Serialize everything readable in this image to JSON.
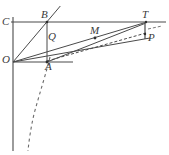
{
  "figure": {
    "type": "geometry-diagram",
    "width": 169,
    "height": 155,
    "background_color": "#ffffff",
    "line_color": "#4a4a4a",
    "label_color": "#3a3a3a",
    "labels": {
      "c": "C",
      "b": "B",
      "t": "T",
      "q": "Q",
      "m": "M",
      "p": "P",
      "o": "O",
      "a": "A"
    },
    "points": {
      "O": [
        13,
        62
      ],
      "C": [
        13,
        22
      ],
      "B": [
        47,
        22
      ],
      "A": [
        47,
        62
      ],
      "Q": [
        47,
        41
      ],
      "T": [
        146,
        22
      ],
      "M": [
        95,
        38
      ],
      "P": [
        146,
        37
      ]
    },
    "label_positions": {
      "c": [
        2,
        17
      ],
      "b": [
        41,
        10
      ],
      "t": [
        142,
        10
      ],
      "q": [
        48,
        32
      ],
      "m": [
        90,
        26
      ],
      "p": [
        148,
        33
      ],
      "o": [
        2,
        55
      ],
      "a": [
        45,
        62
      ]
    },
    "elements": {
      "vertical_axis": "vertical line through O",
      "top_horizontal": "horizontal line through C, B and T",
      "lower_horizontal": "horizontal ray from O past A",
      "rectangle": "rectangle O-C-B-A",
      "ray_OB": "ray from O through B extended",
      "ray_OT": "ray from O through Q and M to T",
      "ray_OP": "ray from O to P",
      "segment_AP": "dashed segment from A to P",
      "segment_AT": "segment from A to T",
      "curve": "dashed curve through A descending",
      "tick_TP": "short vertical tick between T and P"
    }
  }
}
